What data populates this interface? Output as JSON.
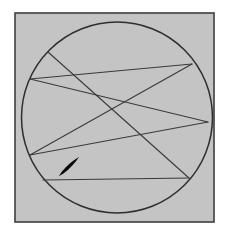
{
  "figure": {
    "caption": "",
    "background_color": "#ffffff"
  },
  "frame": {
    "name": "outer-square-frame",
    "x": 15,
    "y": 13,
    "width": 199,
    "height": 209,
    "fill_color": "#c8c8c8",
    "stroke_color": "#3c3c3c",
    "stroke_width": 1.6
  },
  "circle": {
    "name": "boundary-circle",
    "cx": 117,
    "cy": 117.5,
    "r": 95.5,
    "fill_color": "none",
    "stroke_color": "#2e2e2e",
    "stroke_width": 1.5
  },
  "vertices": [
    {
      "id": "v1",
      "label": "P1",
      "x": 48,
      "y": 52
    },
    {
      "id": "v2",
      "label": "P2",
      "x": 30,
      "y": 79
    },
    {
      "id": "v3",
      "label": "P3",
      "x": 192,
      "y": 64
    },
    {
      "id": "v4",
      "label": "P4",
      "x": 208,
      "y": 122
    },
    {
      "id": "v5",
      "label": "P5",
      "x": 189,
      "y": 178
    },
    {
      "id": "v6",
      "label": "P6",
      "x": 30,
      "y": 155
    },
    {
      "id": "v7",
      "label": "P7",
      "x": 43,
      "y": 180
    }
  ],
  "chords": [
    {
      "id": "c1",
      "name": "chord-p1-p5",
      "x1": 48,
      "y1": 52,
      "x2": 189,
      "y2": 178,
      "stroke_color": "#3a3a3a",
      "stroke_width": 1.1
    },
    {
      "id": "c2",
      "name": "chord-p2-p3",
      "x1": 30,
      "y1": 79,
      "x2": 192,
      "y2": 64,
      "stroke_color": "#3a3a3a",
      "stroke_width": 1.1
    },
    {
      "id": "c3",
      "name": "chord-p2-p4",
      "x1": 30,
      "y1": 79,
      "x2": 208,
      "y2": 122,
      "stroke_color": "#3a3a3a",
      "stroke_width": 1.1
    },
    {
      "id": "c4",
      "name": "chord-p3-p6",
      "x1": 192,
      "y1": 64,
      "x2": 30,
      "y2": 155,
      "stroke_color": "#3a3a3a",
      "stroke_width": 1.1
    },
    {
      "id": "c5",
      "name": "chord-p4-p6",
      "x1": 208,
      "y1": 122,
      "x2": 30,
      "y2": 155,
      "stroke_color": "#3a3a3a",
      "stroke_width": 1.1
    },
    {
      "id": "c6",
      "name": "chord-p5-p7",
      "x1": 189,
      "y1": 178,
      "x2": 43,
      "y2": 180,
      "stroke_color": "#3a3a3a",
      "stroke_width": 1.1
    }
  ],
  "marker": {
    "name": "direction-arrow-marker",
    "x1": 59,
    "y1": 176,
    "x2": 79,
    "y2": 157,
    "stroke_color": "#0a0a0a",
    "max_stroke_width": 3.4,
    "description": "thick tapered barb along the lower-left chord indicating travel direction"
  }
}
